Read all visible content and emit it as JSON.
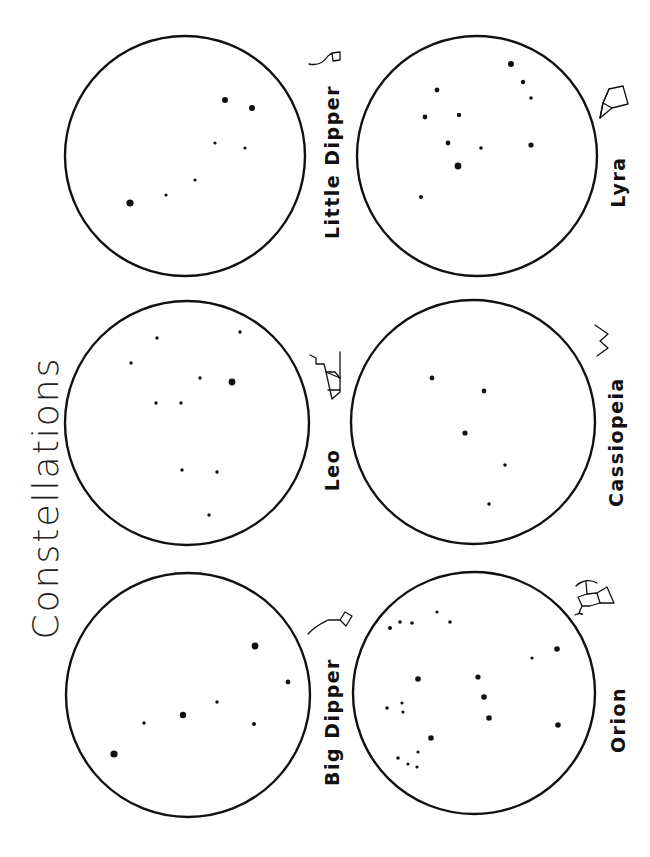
{
  "page": {
    "title": "Constellations",
    "orientation": "rotated 90° clockwise (landscape worksheet)",
    "background": "#ffffff",
    "ink": "#111111"
  },
  "constellations": [
    {
      "name": "Little Dipper",
      "icon": "little-dipper-icon",
      "circle": {
        "cx": 185,
        "cy": 156,
        "r": 120
      },
      "label_pos": {
        "x": 339,
        "y": 162
      },
      "icon_pos": {
        "x": 330,
        "y": 68
      },
      "stars": [
        {
          "x": 225,
          "y": 100,
          "r": 3.0
        },
        {
          "x": 252,
          "y": 108,
          "r": 3.0
        },
        {
          "x": 215,
          "y": 143,
          "r": 1.6
        },
        {
          "x": 245,
          "y": 148,
          "r": 1.6
        },
        {
          "x": 195,
          "y": 180,
          "r": 1.6
        },
        {
          "x": 166,
          "y": 195,
          "r": 1.6
        },
        {
          "x": 130,
          "y": 203,
          "r": 3.6
        }
      ]
    },
    {
      "name": "Lyra",
      "icon": "lyra-icon",
      "circle": {
        "cx": 477,
        "cy": 156,
        "r": 120
      },
      "label_pos": {
        "x": 625,
        "y": 182
      },
      "icon_pos": {
        "x": 612,
        "y": 100
      },
      "stars": [
        {
          "x": 511,
          "y": 64,
          "r": 3.0
        },
        {
          "x": 523,
          "y": 82,
          "r": 2.2
        },
        {
          "x": 531,
          "y": 98,
          "r": 1.8
        },
        {
          "x": 437,
          "y": 90,
          "r": 2.4
        },
        {
          "x": 425,
          "y": 117,
          "r": 2.4
        },
        {
          "x": 459,
          "y": 115,
          "r": 2.2
        },
        {
          "x": 448,
          "y": 143,
          "r": 2.4
        },
        {
          "x": 481,
          "y": 148,
          "r": 1.8
        },
        {
          "x": 531,
          "y": 145,
          "r": 2.6
        },
        {
          "x": 458,
          "y": 166,
          "r": 3.4
        },
        {
          "x": 421,
          "y": 197,
          "r": 2.0
        }
      ]
    },
    {
      "name": "Leo",
      "icon": "leo-icon",
      "circle": {
        "cx": 187,
        "cy": 423,
        "r": 122
      },
      "label_pos": {
        "x": 339,
        "y": 470
      },
      "icon_pos": {
        "x": 330,
        "y": 375
      },
      "stars": [
        {
          "x": 240,
          "y": 332,
          "r": 1.7
        },
        {
          "x": 157,
          "y": 338,
          "r": 1.7
        },
        {
          "x": 131,
          "y": 363,
          "r": 1.7
        },
        {
          "x": 200,
          "y": 378,
          "r": 1.7
        },
        {
          "x": 232,
          "y": 382,
          "r": 3.4
        },
        {
          "x": 156,
          "y": 403,
          "r": 1.7
        },
        {
          "x": 181,
          "y": 403,
          "r": 1.7
        },
        {
          "x": 182,
          "y": 470,
          "r": 1.7
        },
        {
          "x": 217,
          "y": 472,
          "r": 1.7
        },
        {
          "x": 209,
          "y": 515,
          "r": 1.7
        }
      ]
    },
    {
      "name": "Cassiopeia",
      "icon": "cassiopeia-icon",
      "circle": {
        "cx": 473,
        "cy": 422,
        "r": 122
      },
      "label_pos": {
        "x": 623,
        "y": 442
      },
      "icon_pos": {
        "x": 605,
        "y": 340
      },
      "stars": [
        {
          "x": 432,
          "y": 378,
          "r": 2.4
        },
        {
          "x": 484,
          "y": 391,
          "r": 2.4
        },
        {
          "x": 465,
          "y": 433,
          "r": 2.6
        },
        {
          "x": 505,
          "y": 465,
          "r": 1.8
        },
        {
          "x": 489,
          "y": 504,
          "r": 1.8
        }
      ]
    },
    {
      "name": "Big Dipper",
      "icon": "big-dipper-icon",
      "circle": {
        "cx": 188,
        "cy": 695,
        "r": 122
      },
      "label_pos": {
        "x": 339,
        "y": 722
      },
      "icon_pos": {
        "x": 325,
        "y": 620
      },
      "stars": [
        {
          "x": 255,
          "y": 646,
          "r": 3.4
        },
        {
          "x": 288,
          "y": 682,
          "r": 2.4
        },
        {
          "x": 217,
          "y": 702,
          "r": 1.7
        },
        {
          "x": 183,
          "y": 715,
          "r": 3.2
        },
        {
          "x": 144,
          "y": 723,
          "r": 1.7
        },
        {
          "x": 254,
          "y": 724,
          "r": 2.0
        },
        {
          "x": 114,
          "y": 754,
          "r": 3.6
        }
      ]
    },
    {
      "name": "Orion",
      "icon": "orion-icon",
      "circle": {
        "cx": 474,
        "cy": 693,
        "r": 121
      },
      "label_pos": {
        "x": 625,
        "y": 720
      },
      "icon_pos": {
        "x": 595,
        "y": 595
      },
      "stars": [
        {
          "x": 437,
          "y": 612,
          "r": 1.6
        },
        {
          "x": 450,
          "y": 622,
          "r": 1.8
        },
        {
          "x": 400,
          "y": 622,
          "r": 1.8
        },
        {
          "x": 412,
          "y": 623,
          "r": 1.8
        },
        {
          "x": 390,
          "y": 628,
          "r": 2.0
        },
        {
          "x": 557,
          "y": 649,
          "r": 2.8
        },
        {
          "x": 532,
          "y": 658,
          "r": 1.6
        },
        {
          "x": 418,
          "y": 679,
          "r": 2.8
        },
        {
          "x": 478,
          "y": 677,
          "r": 2.6
        },
        {
          "x": 484,
          "y": 697,
          "r": 2.8
        },
        {
          "x": 489,
          "y": 718,
          "r": 2.8
        },
        {
          "x": 558,
          "y": 725,
          "r": 2.8
        },
        {
          "x": 387,
          "y": 708,
          "r": 1.8
        },
        {
          "x": 402,
          "y": 703,
          "r": 1.6
        },
        {
          "x": 403,
          "y": 712,
          "r": 1.6
        },
        {
          "x": 431,
          "y": 738,
          "r": 2.8
        },
        {
          "x": 418,
          "y": 752,
          "r": 1.6
        },
        {
          "x": 398,
          "y": 758,
          "r": 1.8
        },
        {
          "x": 408,
          "y": 764,
          "r": 1.6
        },
        {
          "x": 417,
          "y": 767,
          "r": 1.6
        }
      ]
    }
  ]
}
